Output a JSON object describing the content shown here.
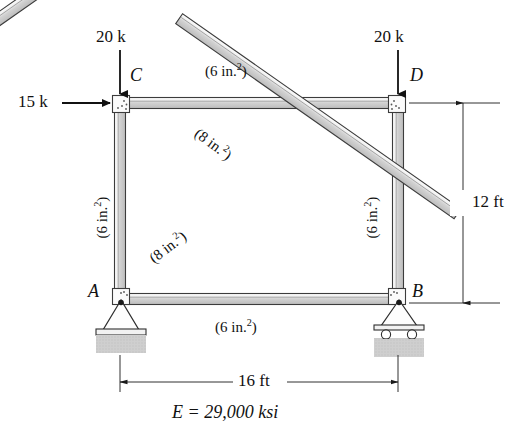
{
  "figure": {
    "modulus_note": "E = 29,000 ksi",
    "colors": {
      "member_fill": "#d9d9d9",
      "member_edge": "#3a3a3a",
      "ground_fill": "#c9c9c9",
      "line": "#1a1a1a",
      "background": "#ffffff"
    }
  },
  "joints": [
    {
      "id": "A",
      "label": "A",
      "x": 120,
      "y": 298,
      "support": "pin"
    },
    {
      "id": "B",
      "label": "B",
      "x": 398,
      "y": 298,
      "support": "roller"
    },
    {
      "id": "C",
      "label": "C",
      "x": 120,
      "y": 103,
      "support": "none"
    },
    {
      "id": "D",
      "label": "D",
      "x": 398,
      "y": 103,
      "support": "none"
    }
  ],
  "members": [
    {
      "id": "CD",
      "from": "C",
      "to": "D",
      "area_label": "(6 in.2)",
      "area_value": 6,
      "area_units": "in.^2"
    },
    {
      "id": "AB",
      "from": "A",
      "to": "B",
      "area_label": "(6 in.2)",
      "area_value": 6,
      "area_units": "in.^2"
    },
    {
      "id": "AC",
      "from": "A",
      "to": "C",
      "area_label": "(6 in.2)",
      "area_value": 6,
      "area_units": "in.^2"
    },
    {
      "id": "BD",
      "from": "B",
      "to": "D",
      "area_label": "(6 in.2)",
      "area_value": 6,
      "area_units": "in.^2"
    },
    {
      "id": "CB",
      "from": "C",
      "to": "B",
      "area_label": "(8 in.2)",
      "area_value": 8,
      "area_units": "in.^2"
    },
    {
      "id": "AD",
      "from": "A",
      "to": "D",
      "area_label": "(8 in.2)",
      "area_value": 8,
      "area_units": "in.^2"
    }
  ],
  "area_labels": {
    "top_chord": {
      "prefix": "(6 in.",
      "sup": "2",
      "suffix": ")"
    },
    "bottom_chord": {
      "prefix": "(6 in.",
      "sup": "2",
      "suffix": ")"
    },
    "left_post": {
      "prefix": "(6 in.",
      "sup": "2",
      "suffix": ")"
    },
    "right_post": {
      "prefix": "(6 in.",
      "sup": "2",
      "suffix": ")"
    },
    "diag_upper": {
      "prefix": "(8 in.",
      "sup": "2",
      "suffix": ")"
    },
    "diag_lower": {
      "prefix": "(8 in.",
      "sup": "2",
      "suffix": ")"
    }
  },
  "loads": [
    {
      "id": "load-C-vertical",
      "label": "20 k",
      "magnitude": 20,
      "units": "k",
      "direction": "down",
      "at_joint": "C"
    },
    {
      "id": "load-D-vertical",
      "label": "20 k",
      "magnitude": 20,
      "units": "k",
      "direction": "down",
      "at_joint": "D"
    },
    {
      "id": "load-C-horizontal",
      "label": "15 k",
      "magnitude": 15,
      "units": "k",
      "direction": "right",
      "at_joint": "C"
    }
  ],
  "dimensions": [
    {
      "id": "height",
      "label": "12 ft",
      "value": 12,
      "units": "ft",
      "orientation": "vertical",
      "between": [
        "D",
        "B"
      ]
    },
    {
      "id": "span",
      "label": "16 ft",
      "value": 16,
      "units": "ft",
      "orientation": "horizontal",
      "between": [
        "A",
        "B"
      ]
    }
  ],
  "material": {
    "label": "E = 29,000 ksi",
    "symbol": "E",
    "value": "29,000",
    "units": "ksi"
  }
}
